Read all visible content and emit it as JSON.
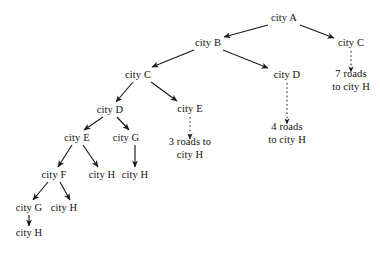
{
  "diagram": {
    "type": "tree",
    "stroke_color": "#1a1a1a",
    "text_color": "#111111",
    "background_color": "#ffffff",
    "nodes": [
      {
        "id": "a",
        "label": "city A",
        "x": 284,
        "y": 18,
        "kind": "node"
      },
      {
        "id": "b",
        "label": "city B",
        "x": 208,
        "y": 43,
        "kind": "node"
      },
      {
        "id": "c_right",
        "label": "city C",
        "x": 351,
        "y": 43,
        "kind": "node"
      },
      {
        "id": "c_left",
        "label": "city C",
        "x": 138,
        "y": 75,
        "kind": "node"
      },
      {
        "id": "d_right",
        "label": "city D",
        "x": 287,
        "y": 75,
        "kind": "node"
      },
      {
        "id": "e_mid",
        "label": "city E",
        "x": 190,
        "y": 109,
        "kind": "node"
      },
      {
        "id": "d_left",
        "label": "city D",
        "x": 110,
        "y": 110,
        "kind": "node"
      },
      {
        "id": "e_left",
        "label": "city E",
        "x": 77,
        "y": 138,
        "kind": "node"
      },
      {
        "id": "g_mid",
        "label": "city G",
        "x": 126,
        "y": 138,
        "kind": "node"
      },
      {
        "id": "f",
        "label": "city F",
        "x": 54,
        "y": 175,
        "kind": "node"
      },
      {
        "id": "h_under_e",
        "label": "city H",
        "x": 102,
        "y": 175,
        "kind": "node"
      },
      {
        "id": "h_under_g",
        "label": "city H",
        "x": 135,
        "y": 175,
        "kind": "node"
      },
      {
        "id": "g_bottom",
        "label": "city G",
        "x": 29,
        "y": 208,
        "kind": "node"
      },
      {
        "id": "h_bottom",
        "label": "city H",
        "x": 64,
        "y": 208,
        "kind": "node"
      },
      {
        "id": "h_last",
        "label": "city H",
        "x": 29,
        "y": 233,
        "kind": "node"
      },
      {
        "id": "roads7",
        "label": "7 roads\nto city H",
        "x": 351,
        "y": 80,
        "kind": "leaf-label"
      },
      {
        "id": "roads4",
        "label": "4 roads\nto city H",
        "x": 287,
        "y": 133,
        "kind": "leaf-label"
      },
      {
        "id": "roads3",
        "label": "3 roads to\ncity H",
        "x": 190,
        "y": 148,
        "kind": "leaf-label"
      }
    ],
    "edges": [
      {
        "from": "a",
        "to": "b",
        "style": "solid",
        "x1": 268,
        "y1": 25,
        "x2": 224,
        "y2": 37
      },
      {
        "from": "a",
        "to": "c_right",
        "style": "solid",
        "x1": 300,
        "y1": 25,
        "x2": 334,
        "y2": 38
      },
      {
        "from": "b",
        "to": "c_left",
        "style": "solid",
        "x1": 194,
        "y1": 50,
        "x2": 152,
        "y2": 67
      },
      {
        "from": "b",
        "to": "d_right",
        "style": "solid",
        "x1": 223,
        "y1": 50,
        "x2": 268,
        "y2": 68
      },
      {
        "from": "c_left",
        "to": "d_left",
        "style": "solid",
        "x1": 133,
        "y1": 82,
        "x2": 116,
        "y2": 102
      },
      {
        "from": "c_left",
        "to": "e_mid",
        "style": "solid",
        "x1": 151,
        "y1": 82,
        "x2": 177,
        "y2": 101
      },
      {
        "from": "d_left",
        "to": "e_left",
        "style": "solid",
        "x1": 103,
        "y1": 117,
        "x2": 84,
        "y2": 130
      },
      {
        "from": "d_left",
        "to": "g_mid",
        "style": "solid",
        "x1": 117,
        "y1": 117,
        "x2": 129,
        "y2": 130
      },
      {
        "from": "e_left",
        "to": "f",
        "style": "solid",
        "x1": 72,
        "y1": 145,
        "x2": 58,
        "y2": 167
      },
      {
        "from": "e_left",
        "to": "h_under_e",
        "style": "solid",
        "x1": 83,
        "y1": 145,
        "x2": 98,
        "y2": 167
      },
      {
        "from": "g_mid",
        "to": "h_under_g",
        "style": "solid",
        "x1": 135,
        "y1": 145,
        "x2": 135,
        "y2": 167
      },
      {
        "from": "f",
        "to": "g_bottom",
        "style": "solid",
        "x1": 48,
        "y1": 182,
        "x2": 33,
        "y2": 200
      },
      {
        "from": "f",
        "to": "h_bottom",
        "style": "solid",
        "x1": 60,
        "y1": 182,
        "x2": 70,
        "y2": 200
      },
      {
        "from": "g_bottom",
        "to": "h_last",
        "style": "solid",
        "x1": 29,
        "y1": 215,
        "x2": 29,
        "y2": 226
      },
      {
        "from": "c_right",
        "to": "roads7",
        "style": "dashed",
        "x1": 351,
        "y1": 51,
        "x2": 351,
        "y2": 72
      },
      {
        "from": "d_right",
        "to": "roads4",
        "style": "dashed",
        "x1": 287,
        "y1": 83,
        "x2": 287,
        "y2": 124
      },
      {
        "from": "e_mid",
        "to": "roads3",
        "style": "dashed",
        "x1": 190,
        "y1": 117,
        "x2": 190,
        "y2": 139
      }
    ]
  }
}
